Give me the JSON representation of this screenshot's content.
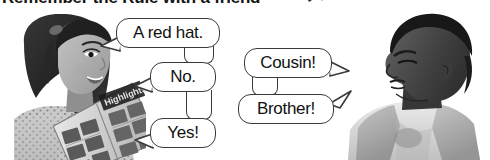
{
  "heading": {
    "text": "Remember the Rule with a friend",
    "arrow_icon": "arrow-pointer-icon"
  },
  "photos": [
    {
      "name": "girl-reading-magazine-photo",
      "subject": "girl",
      "description": "Girl with long dark hair holding an open magazine",
      "style": "grayscale"
    },
    {
      "name": "boy-profile-photo",
      "subject": "boy",
      "description": "Boy in profile facing left wearing a vest over a t-shirt",
      "style": "grayscale"
    }
  ],
  "bubbles": [
    {
      "id": "a-red-hat",
      "text": "A red hat.",
      "tail": "left",
      "speaker": "girl"
    },
    {
      "id": "no",
      "text": "No.",
      "tail": "left",
      "speaker": "girl"
    },
    {
      "id": "yes",
      "text": "Yes!",
      "tail": "left",
      "speaker": "girl"
    },
    {
      "id": "cousin",
      "text": "Cousin!",
      "tail": "right",
      "speaker": "boy"
    },
    {
      "id": "brother",
      "text": "Brother!",
      "tail": "right",
      "speaker": "boy"
    }
  ],
  "colors": {
    "page_background": "#ffffff",
    "bubble_outline": "#3a3a3a",
    "bubble_fill": "#ffffff",
    "text": "#111111",
    "heading_text": "#141414"
  }
}
